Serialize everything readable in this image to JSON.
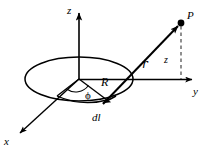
{
  "figure": {
    "stroke_color": "#000000",
    "background_color": "#ffffff",
    "dashed_color": "#555555"
  },
  "axes": {
    "z": {
      "label": "z",
      "x": 67,
      "y": 5
    },
    "y": {
      "label": "y",
      "x": 193,
      "y": 86
    },
    "x": {
      "label": "x",
      "x": 4,
      "y": 136
    }
  },
  "points": {
    "P": {
      "label": "P",
      "x": 187,
      "y": 10
    }
  },
  "annotations": {
    "separation_vector": {
      "label": "ℓ",
      "script_label": "r",
      "x": 142,
      "y": 58
    },
    "height": {
      "label": "z",
      "x": 164,
      "y": 55
    },
    "radius": {
      "label": "R",
      "x": 101,
      "y": 76
    },
    "angle": {
      "label": "ϕ",
      "x": 85,
      "y": 90
    },
    "line_element": {
      "label": "dl",
      "x": 92,
      "y": 112
    }
  },
  "geometry": {
    "origin": {
      "x": 79,
      "y": 79
    },
    "loop": {
      "cx": 79,
      "cy": 79,
      "rx": 54,
      "ry": 22
    },
    "dl_point": {
      "x": 107,
      "y": 101
    },
    "p_point": {
      "x": 181,
      "y": 23
    },
    "z_foot": {
      "x": 181,
      "y": 80
    }
  }
}
